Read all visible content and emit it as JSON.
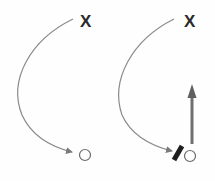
{
  "diagram": {
    "panels": [
      {
        "name": "left-panel",
        "start_marker": "X",
        "path": "curved-arrow",
        "end_marker": "circle"
      },
      {
        "name": "right-panel",
        "start_marker": "X",
        "path": "curved-arrow",
        "end_marker": "circle",
        "block": "screen-bar",
        "extra_arrow": "straight-up-arrow"
      }
    ],
    "colors": {
      "marker": "#2a2a2a",
      "curve": "#8a8a8a",
      "straight_arrow": "#707070",
      "circle": "#6a6a6a",
      "block": "#1e1e1e"
    }
  }
}
